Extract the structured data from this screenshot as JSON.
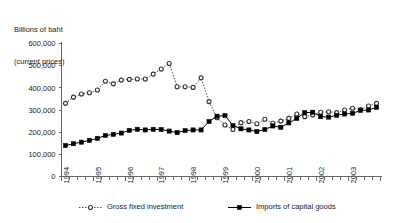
{
  "chart_data": {
    "type": "line",
    "title": "",
    "ylabel_lines": [
      "Billions of baht",
      "(current prices)"
    ],
    "xlabel": "",
    "ylim": [
      0,
      600000
    ],
    "ytick_labels": [
      "0",
      "100,000",
      "200,000",
      "300,000",
      "400,000",
      "500,000",
      "600,000"
    ],
    "ytick_values": [
      0,
      100000,
      200000,
      300000,
      400000,
      500000,
      600000
    ],
    "xtick_labels": [
      "1994",
      "1995",
      "1996",
      "1997",
      "1998",
      "1999",
      "2000",
      "2001",
      "2002",
      "2003"
    ],
    "x_minor_per_major": 4,
    "grid": false,
    "legend_position": "bottom",
    "x": [
      "1994Q1",
      "1994Q2",
      "1994Q3",
      "1994Q4",
      "1995Q1",
      "1995Q2",
      "1995Q3",
      "1995Q4",
      "1996Q1",
      "1996Q2",
      "1996Q3",
      "1996Q4",
      "1997Q1",
      "1997Q2",
      "1997Q3",
      "1997Q4",
      "1998Q1",
      "1998Q2",
      "1998Q3",
      "1998Q4",
      "1999Q1",
      "1999Q2",
      "1999Q3",
      "1999Q4",
      "2000Q1",
      "2000Q2",
      "2000Q3",
      "2000Q4",
      "2001Q1",
      "2001Q2",
      "2001Q3",
      "2001Q4",
      "2002Q1",
      "2002Q2",
      "2002Q3",
      "2002Q4",
      "2003Q1",
      "2003Q2",
      "2003Q3",
      "2003Q4"
    ],
    "series": [
      {
        "name": "Gross fixed investment",
        "marker": "open-circle",
        "linestyle": "dotted",
        "color": "#333333",
        "values": [
          330000,
          358000,
          372000,
          378000,
          390000,
          430000,
          418000,
          435000,
          438000,
          440000,
          440000,
          462000,
          485000,
          510000,
          405000,
          405000,
          402000,
          445000,
          338000,
          265000,
          232000,
          212000,
          243000,
          248000,
          238000,
          258000,
          240000,
          250000,
          262000,
          282000,
          270000,
          278000,
          290000,
          292000,
          288000,
          300000,
          308000,
          302000,
          318000,
          330000
        ]
      },
      {
        "name": "Imports of capital goods",
        "marker": "filled-square",
        "linestyle": "solid",
        "color": "#000000",
        "values": [
          140000,
          148000,
          155000,
          163000,
          172000,
          185000,
          190000,
          196000,
          208000,
          213000,
          210000,
          213000,
          212000,
          205000,
          198000,
          207000,
          210000,
          210000,
          248000,
          272000,
          275000,
          230000,
          215000,
          210000,
          203000,
          212000,
          228000,
          222000,
          242000,
          262000,
          288000,
          290000,
          270000,
          268000,
          276000,
          282000,
          285000,
          298000,
          300000,
          312000
        ]
      }
    ],
    "legend": [
      {
        "label": "Gross fixed investment",
        "marker": "open-circle",
        "linestyle": "dotted"
      },
      {
        "label": "Imports of capital goods",
        "marker": "filled-square",
        "linestyle": "solid"
      }
    ]
  }
}
